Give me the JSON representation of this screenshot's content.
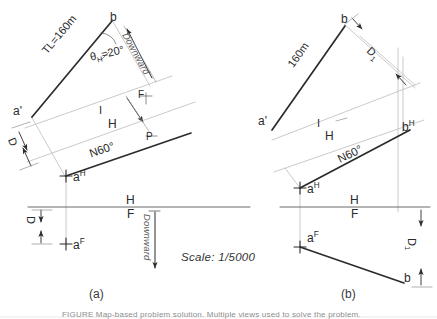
{
  "figure": {
    "scale_label": "Scale: 1/5000",
    "caption_a": "(a)",
    "caption_b": "(b)",
    "bottom_note": "FIGURE Map-based problem solution. Multiple views used to solve the problem."
  },
  "panel_a": {
    "point_b": "b",
    "point_a_front_aux": "a'",
    "point_a_h": "a",
    "point_a_h_sup": "H",
    "point_a_f": "a",
    "point_a_f_sup": "F",
    "true_length": "TL=160m",
    "angle": "θ",
    "angle_sub": "H",
    "angle_value": "=20°",
    "bearing": "N60°",
    "fold_top": "H",
    "fold_bottom": "F",
    "aux_fold_top": "I",
    "aux_fold_bottom": "H",
    "marker_f": "F",
    "marker_p": "P",
    "dim_d_incline": "D",
    "dim_d_vertical": "D",
    "downward_incline": "Downward",
    "downward_vertical": "Downward"
  },
  "panel_b": {
    "point_b_top": "b",
    "point_a_front_aux": "a'",
    "point_b_h": "b",
    "point_b_h_sup": "H",
    "point_a_h": "a",
    "point_a_h_sup": "H",
    "point_a_f": "a",
    "point_a_f_sup": "F",
    "point_b_bottom": "b",
    "true_length": "160m",
    "bearing": "N60°",
    "fold_top": "H",
    "fold_bottom": "F",
    "aux_fold_top": "I",
    "aux_fold_bottom": "H",
    "dim_d1_incline": "D",
    "dim_d1_incline_sub": "1",
    "dim_d1_vertical": "D",
    "dim_d1_vertical_sub": "1"
  },
  "colors": {
    "ink": "#2b2b2b",
    "thin": "#b9b9b9",
    "paper": "#ffffff"
  }
}
